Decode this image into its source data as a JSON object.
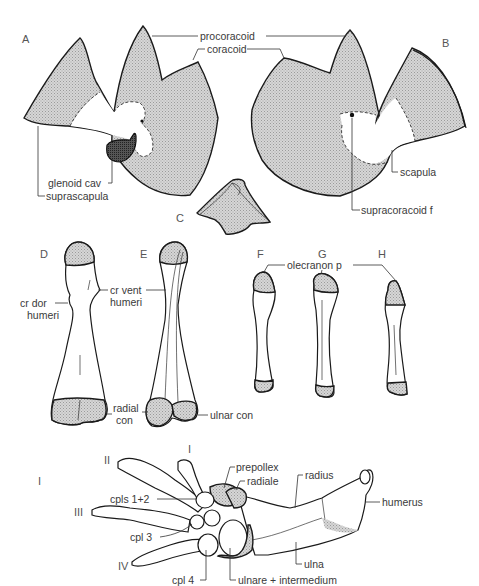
{
  "figure": {
    "panels": [
      "A",
      "B",
      "C",
      "D",
      "E",
      "F",
      "G",
      "H",
      "I"
    ],
    "labels": {
      "procoracoid": "procoracoid",
      "coracoid": "coracoid",
      "glenoid_cav": "glenoid cav",
      "suprascapula": "suprascapula",
      "scapula": "scapula",
      "supracoracoid_f": "supracoracoid f",
      "cr_dor_humeri_1": "cr dor",
      "cr_dor_humeri_2": "humeri",
      "cr_vent_humeri_1": "cr vent",
      "cr_vent_humeri_2": "humeri",
      "radial_con_1": "radial",
      "radial_con_2": "con",
      "ulnar_con": "ulnar con",
      "olecranon_p": "olecranon p",
      "prepollex": "prepollex",
      "radiale": "radiale",
      "radius": "radius",
      "humerus": "humerus",
      "cpls_1_2": "cpls 1+2",
      "cpl_3": "cpl 3",
      "cpl_4": "cpl 4",
      "ulna": "ulna",
      "ulnare_intermedium": "ulnare + intermedium"
    },
    "digits": [
      "I",
      "II",
      "III",
      "IV"
    ],
    "colors": {
      "stipple": "#c8c8c8",
      "outline": "#1a1a1a",
      "text": "#3a3a3a"
    }
  }
}
